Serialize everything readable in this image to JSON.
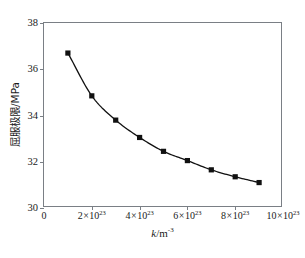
{
  "chart_data": {
    "type": "line",
    "title": "",
    "xlabel": "k/m-3",
    "xlabel_main": "k",
    "xlabel_unit": "/m",
    "xlabel_exp": "-3",
    "ylabel": "屈服极限/MPa",
    "x": [
      1e+23,
      2e+23,
      3e+23,
      4e+23,
      5e+23,
      6e+23,
      7e+23,
      8e+23,
      9e+23
    ],
    "values": [
      36.7,
      34.85,
      33.8,
      33.05,
      32.45,
      32.05,
      31.65,
      31.35,
      31.1
    ],
    "series": [
      {
        "name": "屈服极限",
        "values": [
          36.7,
          34.85,
          33.8,
          33.05,
          32.45,
          32.05,
          31.65,
          31.35,
          31.1
        ]
      }
    ],
    "xlim": [
      0,
      1e+24
    ],
    "ylim": [
      30,
      38
    ],
    "xticks": [
      0,
      2e+23,
      4e+23,
      6e+23,
      8e+23,
      1e+24
    ],
    "yticks": [
      30,
      32,
      34,
      36,
      38
    ],
    "xtick_labels": [
      "0",
      "2x10^23",
      "4x10^23",
      "6x10^23",
      "8x10^23",
      "10x10^23"
    ],
    "ytick_labels": [
      "30",
      "32",
      "34",
      "36",
      "38"
    ],
    "grid": false,
    "legend": "none",
    "marker": "square",
    "marker_color": "#111111",
    "line_color": "#111111"
  },
  "axes": {
    "y_ticks": [
      {
        "label": "38",
        "value": 38
      },
      {
        "label": "36",
        "value": 36
      },
      {
        "label": "34",
        "value": 34
      },
      {
        "label": "32",
        "value": 32
      },
      {
        "label": "30",
        "value": 30
      }
    ],
    "x_ticks": [
      {
        "label": "0",
        "coeff": "0",
        "exp": "",
        "value": 0
      },
      {
        "label": "2x10^23",
        "coeff": "2",
        "exp": "23",
        "value": 2e+23
      },
      {
        "label": "4x10^23",
        "coeff": "4",
        "exp": "23",
        "value": 4e+23
      },
      {
        "label": "6x10^23",
        "coeff": "6",
        "exp": "23",
        "value": 6e+23
      },
      {
        "label": "8x10^23",
        "coeff": "8",
        "exp": "23",
        "value": 8e+23
      },
      {
        "label": "10x10^23",
        "coeff": "10",
        "exp": "23",
        "value": 1e+24
      }
    ],
    "x_title_main": "k",
    "x_title_unit": "/m",
    "x_title_exp": "-3",
    "y_title": "屈服极限/MPa"
  },
  "caption": {
    "text": ""
  },
  "colors": {
    "frame": "#7a7f85",
    "data": "#111111",
    "background": "#ffffff",
    "text": "#1a1a1a"
  }
}
